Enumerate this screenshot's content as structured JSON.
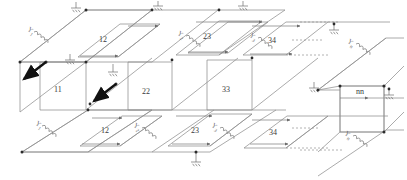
{
  "figure": {
    "type": "isometric-network-lattice-diagram",
    "title": "",
    "background_color": "#ffffff",
    "line_color": "#8a8a8a",
    "dark_line_color": "#5a5a5a",
    "node_color": "#2b2b2b",
    "arrow_color": "#111111",
    "label_color": "#3a3a3a"
  },
  "cells": {
    "top_layer": [
      {
        "id": "cell-top-12",
        "label": "12",
        "x": 99,
        "y": 36
      },
      {
        "id": "cell-top-23",
        "label": "23",
        "x": 203,
        "y": 33
      },
      {
        "id": "cell-top-34",
        "label": "34",
        "x": 268,
        "y": 37
      }
    ],
    "middle_layer": [
      {
        "id": "cell-mid-11",
        "label": "11",
        "x": 54,
        "y": 86
      },
      {
        "id": "cell-mid-22",
        "label": "22",
        "x": 142,
        "y": 88
      },
      {
        "id": "cell-mid-33",
        "label": "33",
        "x": 222,
        "y": 86
      },
      {
        "id": "cell-mid-nn",
        "label": "nn",
        "x": 356,
        "y": 88
      }
    ],
    "bottom_layer": [
      {
        "id": "cell-bot-12",
        "label": "12",
        "x": 101,
        "y": 127
      },
      {
        "id": "cell-bot-23",
        "label": "23",
        "x": 191,
        "y": 127
      },
      {
        "id": "cell-bot-34",
        "label": "34",
        "x": 269,
        "y": 129
      }
    ]
  },
  "admittances": [
    {
      "id": "y-top-left",
      "symbol": "Y",
      "subscript": "1",
      "x": 30,
      "y": 26,
      "rotation": 38
    },
    {
      "id": "y-top-mid",
      "symbol": "Y",
      "subscript": "2",
      "x": 180,
      "y": 30,
      "rotation": 38
    },
    {
      "id": "y-top-right",
      "symbol": "Y",
      "subscript": "3",
      "x": 252,
      "y": 32,
      "rotation": 38
    },
    {
      "id": "y-top-far",
      "symbol": "Y",
      "subscript": "n",
      "x": 350,
      "y": 38,
      "rotation": 38
    },
    {
      "id": "y-bot-left",
      "symbol": "Y",
      "subscript": "1",
      "x": 38,
      "y": 120,
      "rotation": 38
    },
    {
      "id": "y-bot-mid",
      "symbol": "Y",
      "subscript": "2",
      "x": 136,
      "y": 122,
      "rotation": 38
    },
    {
      "id": "y-bot-right",
      "symbol": "Y",
      "subscript": "3",
      "x": 214,
      "y": 122,
      "rotation": 38
    },
    {
      "id": "y-bot-far",
      "symbol": "Y",
      "subscript": "n",
      "x": 347,
      "y": 130,
      "rotation": 38
    }
  ],
  "grounds": [
    {
      "id": "ground-top-1",
      "x": 76,
      "y": 8
    },
    {
      "id": "ground-mid-1",
      "x": 70,
      "y": 60
    },
    {
      "id": "ground-top-2",
      "x": 158,
      "y": 6
    },
    {
      "id": "ground-mid-2",
      "x": 113,
      "y": 72
    },
    {
      "id": "ground-top-3",
      "x": 243,
      "y": 6
    },
    {
      "id": "ground-bot-1",
      "x": 196,
      "y": 162
    },
    {
      "id": "ground-far-1",
      "x": 334,
      "y": 30
    },
    {
      "id": "ground-far-2",
      "x": 314,
      "y": 88
    },
    {
      "id": "ground-far-3",
      "x": 389,
      "y": 95
    }
  ],
  "arrows": [
    {
      "id": "source-arrow-1",
      "x1": 46,
      "y1": 62,
      "x2": 21,
      "y2": 82
    },
    {
      "id": "source-arrow-2",
      "x1": 116,
      "y1": 84,
      "x2": 92,
      "y2": 103
    }
  ],
  "continuation": {
    "dash_label": "",
    "note": "dashed lines indicate repeated cells continuing to the n-th element"
  }
}
